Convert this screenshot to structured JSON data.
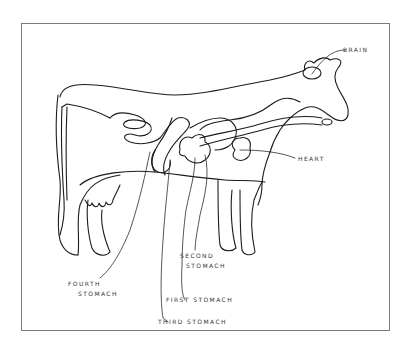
{
  "diagram": {
    "labels": {
      "brain": "BRAIN",
      "heart": "HEART",
      "second_stomach_line1": "SECOND",
      "second_stomach_line2": "STOMACH",
      "fourth_stomach_line1": "FOURTH",
      "fourth_stomach_line2": "STOMACH",
      "first_stomach": "FIRST STOMACH",
      "third_stomach": "THIRD STOMACH"
    },
    "colors": {
      "line": "#1c1c1c",
      "frame": "#7a7a7a",
      "background": "#ffffff"
    }
  }
}
